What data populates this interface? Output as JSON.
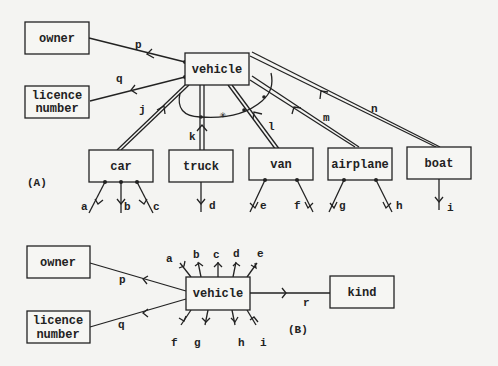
{
  "diagram_a": {
    "panel_label": "(A)",
    "entities": {
      "owner": "owner",
      "licence": [
        "licence",
        "number"
      ],
      "vehicle": "vehicle",
      "car": "car",
      "truck": "truck",
      "van": "van",
      "airplane": "airplane",
      "boat": "boat"
    },
    "relationship_labels": {
      "p": "p",
      "q": "q",
      "j": "j",
      "k": "k",
      "l": "l",
      "m": "m",
      "n": "n",
      "a": "a",
      "b": "b",
      "c": "c",
      "d": "d",
      "e": "e",
      "f": "f",
      "g": "g",
      "h": "h",
      "i": "i"
    },
    "exclusion_marker": "✳"
  },
  "diagram_b": {
    "panel_label": "(B)",
    "entities": {
      "owner": "owner",
      "licence": [
        "licence",
        "number"
      ],
      "vehicle": "vehicle",
      "kind": "kind"
    },
    "relationship_labels": {
      "p": "p",
      "q": "q",
      "r": "r",
      "a": "a",
      "b": "b",
      "c": "c",
      "d": "d",
      "e": "e",
      "f": "f",
      "g": "g",
      "h": "h",
      "i": "i"
    }
  }
}
